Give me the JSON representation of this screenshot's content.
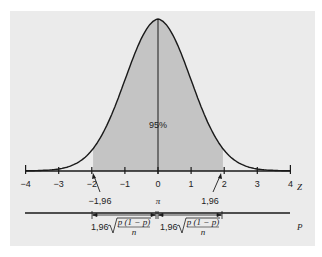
{
  "chart_data": {
    "type": "area",
    "title": "",
    "xlabel": "Z",
    "secondary_xlabel": "P",
    "x_ticks": [
      -4,
      -3,
      -2,
      -1,
      0,
      1,
      2,
      3,
      4
    ],
    "xlim": [
      -4,
      4
    ],
    "shaded_region": [
      -1.96,
      1.96
    ],
    "center_label": "95%",
    "annotations": [
      {
        "text": "-1,96",
        "x": -1.96
      },
      {
        "text": "π",
        "x": 0
      },
      {
        "text": "1,96",
        "x": 1.96
      }
    ],
    "interval_formula": "1,96 √(p(1−p)/n)",
    "intervals": [
      {
        "from": -1.96,
        "to": 0,
        "label": "1,96 √(p(1−p)/n)"
      },
      {
        "from": 0,
        "to": 1.96,
        "label": "1,96 √(p(1−p)/n)"
      }
    ],
    "grid": false,
    "legend": null
  },
  "labels": {
    "center": "95%",
    "z_axis": "Z",
    "p_axis": "P",
    "neg_crit": "−1,96",
    "pos_crit": "1,96",
    "pi": "π",
    "coef": "1,96",
    "numerator": "p (1 − p)",
    "denominator": "n",
    "ticks": [
      "−4",
      "−3",
      "−2",
      "−1",
      "0",
      "1",
      "2",
      "3",
      "4"
    ]
  },
  "colors": {
    "background": "#ebebeb",
    "shade": "#c4c4c4",
    "line": "#1a1a1a"
  }
}
